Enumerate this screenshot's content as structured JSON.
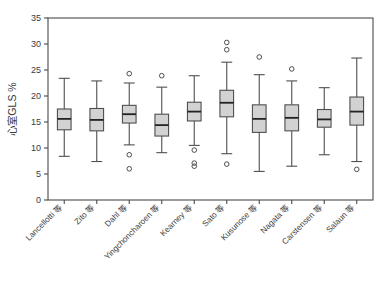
{
  "chart_data": {
    "type": "box",
    "title": "",
    "subtitle": "",
    "xlabel": "",
    "ylabel": "心室GLS %",
    "ylim": [
      0,
      35
    ],
    "yticks": [
      0,
      5,
      10,
      15,
      20,
      25,
      30,
      35
    ],
    "ytick_labels": [
      "0",
      "5",
      "10",
      "15",
      "20",
      "25",
      "30",
      "35"
    ],
    "grid": false,
    "legend": "none",
    "categories": [
      "Lancellotti 等",
      "Zito 等",
      "Dahl 等",
      "Yingchoncharoen 等",
      "Kearney 等",
      "Sato 等",
      "Kusunose 等",
      "Nagata 等",
      "Carstensen 等",
      "Salaun 等"
    ],
    "boxes": [
      {
        "label": "Lancellotti 等",
        "whisker_low": 8.4,
        "q1": 13.5,
        "median": 15.6,
        "q3": 17.5,
        "whisker_high": 23.4,
        "outliers": []
      },
      {
        "label": "Zito 等",
        "whisker_low": 7.4,
        "q1": 13.3,
        "median": 15.4,
        "q3": 17.6,
        "whisker_high": 22.9,
        "outliers": []
      },
      {
        "label": "Dahl 等",
        "whisker_low": 10.6,
        "q1": 14.8,
        "median": 16.5,
        "q3": 18.2,
        "whisker_high": 22.5,
        "outliers": [
          24.3,
          8.7,
          6.0
        ]
      },
      {
        "label": "Yingchoncharoen 等",
        "whisker_low": 9.1,
        "q1": 12.3,
        "median": 14.4,
        "q3": 16.5,
        "whisker_high": 21.7,
        "outliers": [
          23.9
        ]
      },
      {
        "label": "Kearney 等",
        "whisker_low": 10.5,
        "q1": 15.2,
        "median": 17.0,
        "q3": 18.8,
        "whisker_high": 23.9,
        "outliers": [
          9.6,
          7.1,
          6.5
        ]
      },
      {
        "label": "Sato 等",
        "whisker_low": 8.9,
        "q1": 16.0,
        "median": 18.7,
        "q3": 21.1,
        "whisker_high": 26.5,
        "outliers": [
          30.3,
          28.9,
          6.9
        ]
      },
      {
        "label": "Kusunose 等",
        "whisker_low": 5.5,
        "q1": 13.0,
        "median": 15.6,
        "q3": 18.3,
        "whisker_high": 24.1,
        "outliers": [
          27.5
        ]
      },
      {
        "label": "Nagata 等",
        "whisker_low": 6.5,
        "q1": 13.3,
        "median": 15.8,
        "q3": 18.3,
        "whisker_high": 22.9,
        "outliers": [
          25.2
        ]
      },
      {
        "label": "Carstensen 等",
        "whisker_low": 8.7,
        "q1": 14.0,
        "median": 15.5,
        "q3": 17.4,
        "whisker_high": 21.6,
        "outliers": []
      },
      {
        "label": "Salaun 等",
        "whisker_low": 7.4,
        "q1": 14.4,
        "median": 17.0,
        "q3": 19.8,
        "whisker_high": 27.3,
        "outliers": [
          5.9
        ]
      }
    ],
    "colors": {
      "box_fill": "#d2d2d2",
      "box_edge": "#4f4f4f",
      "median": "#222222",
      "whisker": "#4f4f4f",
      "outlier": "#4f4f4f",
      "axis": "#4a4a4a",
      "text": "#3b3b3b",
      "background": "#ffffff"
    }
  }
}
